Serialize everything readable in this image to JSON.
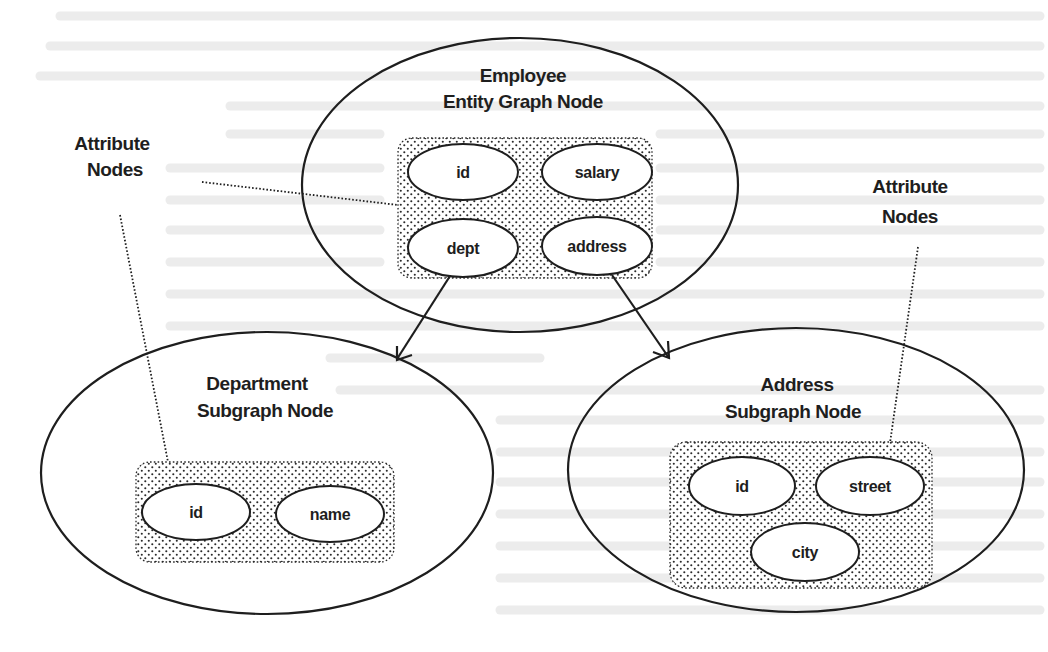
{
  "diagram": {
    "colors": {
      "stroke": "#1e1e1e",
      "background": "#ffffff",
      "stipple": "#2a2a2a",
      "bleed_through": "#ececec"
    },
    "callouts": {
      "left": {
        "line1": "Attribute",
        "line2": "Nodes"
      },
      "right": {
        "line1": "Attribute",
        "line2": "Nodes"
      }
    },
    "nodes": {
      "employee": {
        "title_line1": "Employee",
        "title_line2": "Entity Graph Node",
        "attributes": [
          "id",
          "salary",
          "dept",
          "address"
        ]
      },
      "department": {
        "title_line1": "Department",
        "title_line2": "Subgraph Node",
        "attributes": [
          "id",
          "name"
        ]
      },
      "address": {
        "title_line1": "Address",
        "title_line2": "Subgraph Node",
        "attributes": [
          "id",
          "street",
          "city"
        ]
      }
    },
    "edges": [
      {
        "from": "employee.dept",
        "to": "department"
      },
      {
        "from": "employee.address",
        "to": "address"
      }
    ]
  }
}
